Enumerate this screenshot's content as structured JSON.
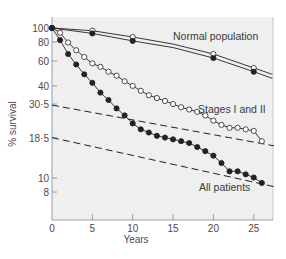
{
  "chart_data": {
    "type": "line",
    "title": "",
    "xlabel": "Years",
    "ylabel": "% survival",
    "xlim": [
      0,
      27.5
    ],
    "yscale": "log",
    "ylim": [
      6,
      100
    ],
    "grid": false,
    "background": "#efefef",
    "x_ticks": [
      0,
      5,
      10,
      15,
      20,
      25
    ],
    "y_ticks": [
      {
        "value": 100,
        "label": "100",
        "py": 28
      },
      {
        "value": 80,
        "label": "80",
        "py": 42
      },
      {
        "value": 60,
        "label": "60",
        "py": 61
      },
      {
        "value": 40,
        "label": "40",
        "py": 86
      },
      {
        "value": 30.5,
        "label": "30·5",
        "py": 104
      },
      {
        "value": 18.5,
        "label": "18·5",
        "py": 138
      },
      {
        "value": 10,
        "label": "10",
        "py": 178
      },
      {
        "value": 8,
        "label": "8",
        "py": 192
      }
    ],
    "legend": null,
    "series": [
      {
        "name": "Normal population (open)",
        "marker": "open-circle",
        "style": "solid",
        "x": [
          0,
          5,
          10,
          15,
          20,
          25,
          27.3
        ],
        "y": [
          100,
          96,
          87,
          78,
          67,
          54,
          49
        ],
        "marker_x": [
          0,
          5,
          10,
          20,
          25
        ]
      },
      {
        "name": "Normal population (filled)",
        "marker": "filled-circle",
        "style": "solid",
        "x": [
          0,
          5,
          10,
          15,
          20,
          25,
          27.3
        ],
        "y": [
          100,
          92,
          82,
          74,
          63,
          51,
          46
        ],
        "marker_x": [
          0,
          5,
          10,
          20,
          25
        ]
      },
      {
        "name": "Stages I and II",
        "marker": "open-circle",
        "style": "solid",
        "x": [
          0,
          1,
          2,
          3,
          4,
          5,
          6,
          7,
          8,
          9,
          10,
          11,
          12,
          13,
          14,
          15,
          16,
          17,
          18,
          19,
          20,
          21,
          22,
          23,
          24,
          25,
          26
        ],
        "y": [
          100,
          93,
          80,
          71,
          64,
          58,
          55,
          51,
          48,
          44,
          41,
          38,
          35.5,
          34,
          32.5,
          31,
          29.5,
          28.5,
          27.5,
          26,
          24,
          22.5,
          21.5,
          21.5,
          21,
          20.5,
          17.5
        ]
      },
      {
        "name": "All patients",
        "marker": "filled-circle",
        "style": "solid",
        "x": [
          0,
          1,
          2,
          3,
          4,
          5,
          6,
          7,
          8,
          9,
          10,
          11,
          12,
          13,
          14,
          15,
          16,
          17,
          18,
          19,
          20,
          21,
          22,
          23,
          24,
          25,
          26
        ],
        "y": [
          100,
          83,
          67,
          57,
          49,
          43,
          37,
          33,
          29,
          26,
          23,
          21,
          20,
          19,
          18.5,
          18,
          17.5,
          17,
          16,
          15,
          14,
          12.5,
          11,
          11,
          10.5,
          10,
          9.2
        ]
      },
      {
        "name": "Stages I and II fitted (dashed)",
        "marker": "none",
        "style": "dashed",
        "x": [
          0,
          27.5
        ],
        "y": [
          30.5,
          16.3
        ]
      },
      {
        "name": "All patients fitted (dashed)",
        "marker": "none",
        "style": "dashed",
        "x": [
          0,
          27.5
        ],
        "y": [
          18.5,
          8.7
        ]
      }
    ],
    "annotations": [
      {
        "text": "Normal population",
        "x": 14.8,
        "y": 92
      },
      {
        "text": "Stages I and II",
        "x": 17.2,
        "y": 34
      },
      {
        "text": "All patients",
        "x": 16.5,
        "y": 9.3
      }
    ]
  },
  "labels": {
    "xlabel": "Years",
    "ylabel": "% survival",
    "normal": "Normal population",
    "stages": "Stages I and II",
    "all": "All patients"
  }
}
